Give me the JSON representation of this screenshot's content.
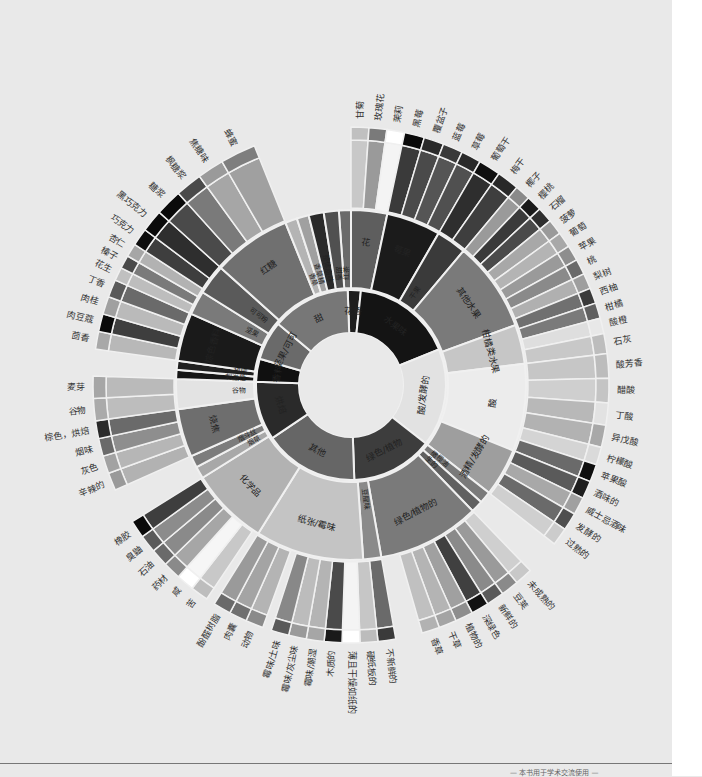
{
  "chart_data": {
    "type": "sunburst",
    "title": "",
    "center": [
      351,
      385
    ],
    "rings": {
      "hole": 52,
      "r1": 95,
      "r2": 175,
      "r3": 245,
      "tip": 258
    },
    "inner": [
      {
        "label": "花香",
        "start": -2,
        "end": 6,
        "fill": "#1e1e1e"
      },
      {
        "label": "水果味",
        "start": 6,
        "end": 68,
        "fill": "#141414"
      },
      {
        "label": "酸/发酵的",
        "start": 68,
        "end": 128,
        "fill": "#e2e2e2"
      },
      {
        "label": "绿色/植物",
        "start": 128,
        "end": 178,
        "fill": "#3d3d3d"
      },
      {
        "label": "其他",
        "start": 178,
        "end": 236,
        "fill": "#666666"
      },
      {
        "label": "烘焙",
        "start": 236,
        "end": 272,
        "fill": "#2a2a2a"
      },
      {
        "label": "香料",
        "start": 272,
        "end": 286,
        "fill": "#101010"
      },
      {
        "label": "坚果/可可",
        "start": 286,
        "end": 310,
        "fill": "#6a6a6a"
      },
      {
        "label": "甜",
        "start": 310,
        "end": 358,
        "fill": "#777777"
      }
    ],
    "middle": [
      {
        "label": "红茶",
        "start": -4,
        "end": 0,
        "fill": "#6a6a6a"
      },
      {
        "label": "花",
        "start": 0,
        "end": 12,
        "fill": "#5e5e5e"
      },
      {
        "label": "莓果",
        "start": 12,
        "end": 30,
        "fill": "#1b1b1b"
      },
      {
        "label": "干果",
        "start": 30,
        "end": 40,
        "fill": "#3a3a3a"
      },
      {
        "label": "其他水果",
        "start": 40,
        "end": 70,
        "fill": "#7a7a7a"
      },
      {
        "label": "柑橘类水果",
        "start": 70,
        "end": 83,
        "fill": "#c6c6c6"
      },
      {
        "label": "酸",
        "start": 83,
        "end": 112,
        "fill": "#ececec"
      },
      {
        "label": "酒精/发酵的",
        "start": 112,
        "end": 128,
        "fill": "#9e9e9e"
      },
      {
        "label": "橄榄油",
        "start": 128,
        "end": 132,
        "fill": "#7a7a7a"
      },
      {
        "label": "生的",
        "start": 132,
        "end": 136,
        "fill": "#606060"
      },
      {
        "label": "绿色/植物的",
        "start": 136,
        "end": 170,
        "fill": "#7a7a7a"
      },
      {
        "label": "豆腥味",
        "start": 170,
        "end": 176,
        "fill": "#8a8a8a"
      },
      {
        "label": "纸张/霉味",
        "start": 176,
        "end": 212,
        "fill": "#c4c4c4"
      },
      {
        "label": "化学品",
        "start": 212,
        "end": 238,
        "fill": "#b2b2b2"
      },
      {
        "label": "烟草",
        "start": 238,
        "end": 242,
        "fill": "#a8a8a8"
      },
      {
        "label": "烟斗丝",
        "start": 242,
        "end": 246,
        "fill": "#7c7c7c"
      },
      {
        "label": "烧焦",
        "start": 246,
        "end": 262,
        "fill": "#6e6e6e"
      },
      {
        "label": "谷物",
        "start": 262,
        "end": 272,
        "fill": "#e3e3e3"
      },
      {
        "label": "刺激性",
        "start": 272,
        "end": 275,
        "fill": "#161616"
      },
      {
        "label": "胡椒",
        "start": 275,
        "end": 278,
        "fill": "#202020"
      },
      {
        "label": "棕色香料",
        "start": 278,
        "end": 294,
        "fill": "#1a1a1a"
      },
      {
        "label": "坚果",
        "start": 294,
        "end": 302,
        "fill": "#7a7a7a"
      },
      {
        "label": "可可粉",
        "start": 302,
        "end": 312,
        "fill": "#5a5a5a"
      },
      {
        "label": "红糖",
        "start": 312,
        "end": 338,
        "fill": "#707070"
      },
      {
        "label": "香草",
        "start": 338,
        "end": 342,
        "fill": "#b4b4b4"
      },
      {
        "label": "香草精",
        "start": 342,
        "end": 346,
        "fill": "#a0a0a0"
      },
      {
        "label": "整体甜味",
        "start": 346,
        "end": 351,
        "fill": "#2a2a2a"
      },
      {
        "label": "甜香",
        "start": 351,
        "end": 356,
        "fill": "#505050"
      }
    ],
    "outer": [
      {
        "label": "甘菊",
        "start": 0,
        "end": 4,
        "fill": "#c8c8c8",
        "tip": "#c0c0c0"
      },
      {
        "label": "玫瑰花",
        "start": 4,
        "end": 8,
        "fill": "#9a9a9a",
        "tip": "#7a7a7a"
      },
      {
        "label": "茉莉",
        "start": 8,
        "end": 12,
        "fill": "#f4f4f4",
        "tip": "#ffffff"
      },
      {
        "label": "黑莓",
        "start": 12,
        "end": 16.5,
        "fill": "#3a3a3a",
        "tip": "#0a0a0a"
      },
      {
        "label": "覆盆子",
        "start": 16.5,
        "end": 21,
        "fill": "#4a4a4a",
        "tip": "#2a2a2a"
      },
      {
        "label": "蓝莓",
        "start": 21,
        "end": 25.5,
        "fill": "#555555",
        "tip": "#3a3a3a"
      },
      {
        "label": "草莓",
        "start": 25.5,
        "end": 30,
        "fill": "#505050",
        "tip": "#2a2a2a"
      },
      {
        "label": "葡萄干",
        "start": 30,
        "end": 35,
        "fill": "#2e2e2e",
        "tip": "#0f0f0f"
      },
      {
        "label": "梅干",
        "start": 35,
        "end": 40,
        "fill": "#3e3e3e",
        "tip": "#282828"
      },
      {
        "label": "椰子",
        "start": 40,
        "end": 43.5,
        "fill": "#9a9a9a",
        "tip": "#8a8a8a"
      },
      {
        "label": "樱桃",
        "start": 43.5,
        "end": 47,
        "fill": "#3a3a3a",
        "tip": "#1a1a1a"
      },
      {
        "label": "石榴",
        "start": 47,
        "end": 50.5,
        "fill": "#4a4a4a",
        "tip": "#2e2e2e"
      },
      {
        "label": "菠萝",
        "start": 50.5,
        "end": 54,
        "fill": "#a8a8a8",
        "tip": "#9a9a9a"
      },
      {
        "label": "葡萄",
        "start": 54,
        "end": 57.5,
        "fill": "#b4b4b4",
        "tip": "#a8a8a8"
      },
      {
        "label": "苹果",
        "start": 57.5,
        "end": 61,
        "fill": "#9a9a9a",
        "tip": "#8e8e8e"
      },
      {
        "label": "桃",
        "start": 61,
        "end": 64.5,
        "fill": "#8a8a8a",
        "tip": "#6a6a6a"
      },
      {
        "label": "梨树",
        "start": 64.5,
        "end": 68,
        "fill": "#b0b0b0",
        "tip": "#9e9e9e"
      },
      {
        "label": "西柚",
        "start": 68,
        "end": 71.5,
        "fill": "#707070",
        "tip": "#3a3a3a"
      },
      {
        "label": "柑橘",
        "start": 71.5,
        "end": 75,
        "fill": "#7a7a7a",
        "tip": "#606060"
      },
      {
        "label": "酸橙",
        "start": 75,
        "end": 78.5,
        "fill": "#dedede",
        "tip": "#e8e8e8"
      },
      {
        "label": "石灰",
        "start": 78.5,
        "end": 83,
        "fill": "#c8c8c8",
        "tip": "#bdbdbd"
      },
      {
        "label": "酸芳香",
        "start": 83,
        "end": 88.5,
        "fill": "#c6c6c6",
        "tip": "#bcbcbc"
      },
      {
        "label": "醋酸",
        "start": 88.5,
        "end": 94,
        "fill": "#cfcfcf",
        "tip": "#c4c4c4"
      },
      {
        "label": "丁酸",
        "start": 94,
        "end": 99,
        "fill": "#b8b8b8",
        "tip": "#e2e2e2"
      },
      {
        "label": "异戊酸",
        "start": 99,
        "end": 104,
        "fill": "#b2b2b2",
        "tip": "#a8a8a8"
      },
      {
        "label": "柠檬酸",
        "start": 104,
        "end": 108,
        "fill": "#d4d4d4",
        "tip": "#dadada"
      },
      {
        "label": "苹果酸",
        "start": 108,
        "end": 112,
        "fill": "#6a6a6a",
        "tip": "#0e0e0e"
      },
      {
        "label": "酒味的",
        "start": 112,
        "end": 116,
        "fill": "#5a5a5a",
        "tip": "#1e1e1e"
      },
      {
        "label": "威士忌酒味",
        "start": 116,
        "end": 120,
        "fill": "#a8a8a8",
        "tip": "#a0a0a0"
      },
      {
        "label": "发酵的",
        "start": 120,
        "end": 124,
        "fill": "#6a6a6a",
        "tip": "#4e4e4e"
      },
      {
        "label": "过熟的",
        "start": 124,
        "end": 128,
        "fill": "#cfcfcf",
        "tip": "#cccccc"
      },
      {
        "label": "未成熟的",
        "start": 136,
        "end": 140,
        "fill": "#cfcfcf",
        "tip": "#c8c8c8"
      },
      {
        "label": "豆荚",
        "start": 140,
        "end": 144,
        "fill": "#9a9a9a",
        "tip": "#8a8a8a"
      },
      {
        "label": "新鲜的",
        "start": 144,
        "end": 148,
        "fill": "#8a8a8a",
        "tip": "#5a5a5a"
      },
      {
        "label": "深绿色",
        "start": 148,
        "end": 152,
        "fill": "#404040",
        "tip": "#121212"
      },
      {
        "label": "植物的",
        "start": 152,
        "end": 156,
        "fill": "#a0a0a0",
        "tip": "#8e8e8e"
      },
      {
        "label": "干草",
        "start": 156,
        "end": 160,
        "fill": "#b4b4b4",
        "tip": "#a4a4a4"
      },
      {
        "label": "香草",
        "start": 160,
        "end": 164,
        "fill": "#c0c0c0",
        "tip": "#b2b2b2"
      },
      {
        "label": "不新鲜的",
        "start": 170,
        "end": 174,
        "fill": "#6a6a6a",
        "tip": "#3a3a3a"
      },
      {
        "label": "硬纸板的",
        "start": 174,
        "end": 178,
        "fill": "#c6c6c6",
        "tip": "#bcbcbc"
      },
      {
        "label": "薄且干燥如纸的",
        "start": 178,
        "end": 182,
        "fill": "#f4f4f4",
        "tip": "#ffffff"
      },
      {
        "label": "木质的",
        "start": 182,
        "end": 186,
        "fill": "#4a4a4a",
        "tip": "#1a1a1a"
      },
      {
        "label": "霉味/潮湿",
        "start": 186,
        "end": 190,
        "fill": "#b4b4b4",
        "tip": "#a6a6a6"
      },
      {
        "label": "霉味/灰尘味",
        "start": 190,
        "end": 194,
        "fill": "#bcbcbc",
        "tip": "#9a9a9a"
      },
      {
        "label": "霉味/土味",
        "start": 194,
        "end": 198,
        "fill": "#888888",
        "tip": "#5a5a5a"
      },
      {
        "label": "动物",
        "start": 200,
        "end": 204,
        "fill": "#b4b4b4",
        "tip": "#8a8a8a"
      },
      {
        "label": "肉囊",
        "start": 204,
        "end": 208,
        "fill": "#a4a4a4",
        "tip": "#707070"
      },
      {
        "label": "酚醛树脂",
        "start": 208,
        "end": 212,
        "fill": "#9a9a9a",
        "tip": "#6a6a6a"
      },
      {
        "label": "苦",
        "start": 214,
        "end": 218,
        "fill": "#c8c8c8",
        "tip": "#bdbdbd"
      },
      {
        "label": "咸",
        "start": 218,
        "end": 222,
        "fill": "#f6f6f6",
        "tip": "#ffffff"
      },
      {
        "label": "药材",
        "start": 222,
        "end": 226,
        "fill": "#a6a6a6",
        "tip": "#8a8a8a"
      },
      {
        "label": "石油",
        "start": 226,
        "end": 230,
        "fill": "#8a8a8a",
        "tip": "#6a6a6a"
      },
      {
        "label": "臭鼬",
        "start": 230,
        "end": 234,
        "fill": "#8c8c8c",
        "tip": "#5a5a5a"
      },
      {
        "label": "橡胶",
        "start": 234,
        "end": 238,
        "fill": "#3e3e3e",
        "tip": "#0a0a0a"
      },
      {
        "label": "辛辣的",
        "start": 246,
        "end": 250,
        "fill": "#b2b2b2",
        "tip": "#9a9a9a"
      },
      {
        "label": "灰色",
        "start": 250,
        "end": 254,
        "fill": "#b6b6b6",
        "tip": "#a2a2a2"
      },
      {
        "label": "烟味",
        "start": 254,
        "end": 258,
        "fill": "#8e8e8e",
        "tip": "#6a6a6a"
      },
      {
        "label": "棕色，烘焙",
        "start": 258,
        "end": 262,
        "fill": "#6a6a6a",
        "tip": "#2a2a2a"
      },
      {
        "label": "谷物",
        "start": 262,
        "end": 267,
        "fill": "#bdbdbd",
        "tip": "#aaaaaa"
      },
      {
        "label": "麦芽",
        "start": 267,
        "end": 272,
        "fill": "#bababa",
        "tip": "#a6a6a6"
      },
      {
        "label": "茴香",
        "start": 278,
        "end": 282,
        "fill": "#b8b8b8",
        "tip": "#a8a8a8"
      },
      {
        "label": "肉豆蔻",
        "start": 282,
        "end": 286,
        "fill": "#3e3e3e",
        "tip": "#0a0a0a"
      },
      {
        "label": "肉桂",
        "start": 286,
        "end": 290,
        "fill": "#bababa",
        "tip": "#a0a0a0"
      },
      {
        "label": "丁香",
        "start": 290,
        "end": 294,
        "fill": "#6a6a6a",
        "tip": "#5a5a5a"
      },
      {
        "label": "花生",
        "start": 294,
        "end": 297,
        "fill": "#bdbdbd",
        "tip": "#c0c0c0"
      },
      {
        "label": "榛子",
        "start": 297,
        "end": 300,
        "fill": "#7a7a7a",
        "tip": "#4a4a4a"
      },
      {
        "label": "杏仁",
        "start": 300,
        "end": 303,
        "fill": "#b2b2b2",
        "tip": "#a6a6a6"
      },
      {
        "label": "巧克力",
        "start": 303,
        "end": 307,
        "fill": "#3e3e3e",
        "tip": "#0e0e0e"
      },
      {
        "label": "黑巧克力",
        "start": 307,
        "end": 312,
        "fill": "#2e2e2e",
        "tip": "#0a0a0a"
      },
      {
        "label": "糖浆",
        "start": 312,
        "end": 318,
        "fill": "#4a4a4a",
        "tip": "#0a0a0a"
      },
      {
        "label": "枫糖浆",
        "start": 318,
        "end": 324,
        "fill": "#7a7a7a",
        "tip": "#4a4a4a"
      },
      {
        "label": "焦糖味",
        "start": 324,
        "end": 330,
        "fill": "#a6a6a6",
        "tip": "#9a9a9a"
      },
      {
        "label": "蜂蜜",
        "start": 330,
        "end": 338,
        "fill": "#a0a0a0",
        "tip": "#7e7e7e"
      }
    ]
  },
  "footer": {
    "text": "— 本书用于学术交流使用 —"
  }
}
